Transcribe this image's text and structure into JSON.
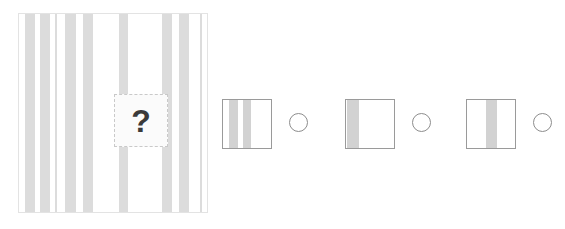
{
  "puzzle": {
    "type": "visual-pattern-completion",
    "prompt_symbol": "?",
    "colors": {
      "stripe": "#dcdcdc",
      "option_stripe": "#d2d2d2",
      "panel_border": "#e3e3e3",
      "option_border": "#9a9a9a",
      "radio_border": "#8d8d8d",
      "question_border": "#c9c9c9",
      "question_mark": "#3a3a3a",
      "background": "#ffffff"
    },
    "main_panel": {
      "name": "striped-pattern-panel",
      "width": 190,
      "height": 200,
      "stripes": [
        {
          "left": 6,
          "width": 10
        },
        {
          "left": 21,
          "width": 10
        },
        {
          "left": 36,
          "width": 2
        },
        {
          "left": 46,
          "width": 11
        },
        {
          "left": 64,
          "width": 10
        },
        {
          "left": 100,
          "width": 9
        },
        {
          "left": 143,
          "width": 10
        },
        {
          "left": 160,
          "width": 10
        },
        {
          "left": 181,
          "width": 2
        }
      ],
      "question_cutout": {
        "left": 95,
        "top": 80,
        "width": 54,
        "height": 53,
        "label": "?"
      }
    },
    "options": [
      {
        "id": "option-1",
        "label": "Option 1",
        "swatch_left": 222,
        "radio_left": 289,
        "selected": false,
        "stripes": [
          {
            "left": 6,
            "width": 9
          },
          {
            "left": 20,
            "width": 8
          }
        ]
      },
      {
        "id": "option-2",
        "label": "Option 2",
        "swatch_left": 345,
        "radio_left": 412,
        "selected": false,
        "stripes": [
          {
            "left": 1,
            "width": 12
          }
        ]
      },
      {
        "id": "option-3",
        "label": "Option 3",
        "swatch_left": 466,
        "radio_left": 533,
        "selected": false,
        "stripes": [
          {
            "left": 19,
            "width": 11
          }
        ]
      }
    ]
  },
  "chart_data": {
    "type": "table",
    "categories": [
      "main-panel",
      "option-1",
      "option-2",
      "option-3"
    ],
    "values": [
      9,
      2,
      1,
      1
    ],
    "xlabel": "element",
    "ylabel": "stripe count"
  }
}
